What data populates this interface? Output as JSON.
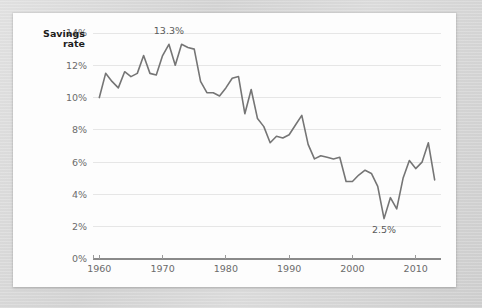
{
  "card": {
    "background_color": "#fdfdfd",
    "surround_color": "#d8d8d8"
  },
  "axis_title": {
    "line1": "Savings",
    "line2": "rate"
  },
  "chart_data": {
    "type": "line",
    "title": "",
    "subtitle": "",
    "xlabel": "",
    "ylabel": "Savings rate",
    "xlim": [
      1959,
      2014
    ],
    "ylim": [
      0,
      14
    ],
    "grid": true,
    "legend": false,
    "legend_position": "none",
    "line_color": "#757575",
    "grid_color": "#e6e6e6",
    "axis_color": "#8a8a8a",
    "ytick_labels": [
      "14%",
      "12%",
      "10%",
      "8%",
      "6%",
      "4%",
      "2%",
      "0%"
    ],
    "ytick_values": [
      14,
      12,
      10,
      8,
      6,
      4,
      2,
      0
    ],
    "xtick_labels": [
      "1960",
      "1970",
      "1980",
      "1990",
      "2000",
      "2010"
    ],
    "xtick_values": [
      1960,
      1970,
      1980,
      1990,
      2000,
      2010
    ],
    "annotations": [
      {
        "text": "13.3%",
        "x": 1971,
        "y": 13.3,
        "dx": 0,
        "dy": -10
      },
      {
        "text": "2.5%",
        "x": 2005,
        "y": 2.5,
        "dx": 0,
        "dy": 14
      }
    ],
    "series": [
      {
        "name": "Personal savings rate",
        "x": [
          1960,
          1961,
          1962,
          1963,
          1964,
          1965,
          1966,
          1967,
          1968,
          1969,
          1970,
          1971,
          1972,
          1973,
          1974,
          1975,
          1976,
          1977,
          1978,
          1979,
          1980,
          1981,
          1982,
          1983,
          1984,
          1985,
          1986,
          1987,
          1988,
          1989,
          1990,
          1991,
          1992,
          1993,
          1994,
          1995,
          1996,
          1997,
          1998,
          1999,
          2000,
          2001,
          2002,
          2003,
          2004,
          2005,
          2006,
          2007,
          2008,
          2009,
          2010,
          2011,
          2012,
          2013
        ],
        "values": [
          10.0,
          11.5,
          11.0,
          10.6,
          11.6,
          11.3,
          11.5,
          12.6,
          11.5,
          11.4,
          12.6,
          13.3,
          12.0,
          13.3,
          13.1,
          13.0,
          11.0,
          10.3,
          10.3,
          10.1,
          10.6,
          11.2,
          11.3,
          9.0,
          10.5,
          8.7,
          8.2,
          7.2,
          7.6,
          7.5,
          7.7,
          8.3,
          8.9,
          7.1,
          6.2,
          6.4,
          6.3,
          6.2,
          6.3,
          4.8,
          4.8,
          5.2,
          5.5,
          5.3,
          4.5,
          2.5,
          3.8,
          3.1,
          5.0,
          6.1,
          5.6,
          6.0,
          7.2,
          4.9
        ]
      }
    ]
  }
}
